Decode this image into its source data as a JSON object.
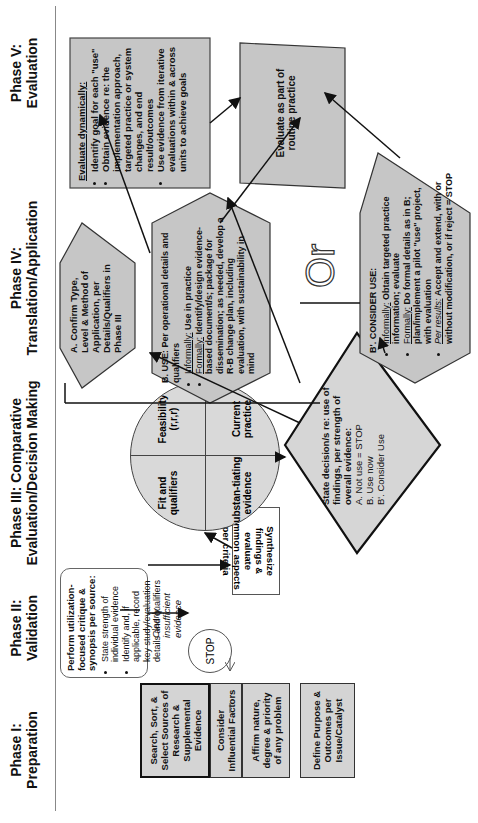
{
  "phases": [
    {
      "title_line1": "Phase I:",
      "title_line2": "Preparation"
    },
    {
      "title_line1": "Phase II:",
      "title_line2": "Validation"
    },
    {
      "title_line1": "Phase III: Comparative",
      "title_line2": "Evaluation/Decision Making"
    },
    {
      "title_line1": "Phase IV:",
      "title_line2": "Translation/Application"
    },
    {
      "title_line1": "Phase V:",
      "title_line2": "Evaluation"
    }
  ],
  "phase1": {
    "boxes": [
      {
        "label": "Search, Sort, & Select Sources of Research & Supplemental Evidence"
      },
      {
        "label": "Consider Influential Factors"
      },
      {
        "label": "Affirm nature, degree & priority of any problem"
      },
      {
        "label": "Define Purpose & Outcomes per Issue/Catalyst"
      }
    ]
  },
  "phase2": {
    "critique_title": "Perform utilization-focused critique & synopsis per source:",
    "critique_bullets": [
      "State strength of individual evidence",
      "Identify and, if applicable, record key study/evaluation details and qualifiers"
    ],
    "stop_label": "STOP",
    "stop_note": "Clearly insufficient evidence",
    "synthesize": "Synthesize findings & evaluate common aspects per criteria"
  },
  "phase3": {
    "quadrants": [
      {
        "label": "Fit and qualifiers"
      },
      {
        "label": "Feasibility (r,r,r)"
      },
      {
        "label": "Substan-tiating evidence"
      },
      {
        "label": "Current practice"
      }
    ],
    "decision": {
      "title": "State decision/s re: use of findings, per strength of overall evidence:",
      "options": [
        "A. Not use = STOP",
        "B. Use now",
        "B'. Consider Use"
      ]
    }
  },
  "phase4": {
    "confirm": "A. Confirm Type, Level & Method of Application, per Details/Qualifiers in Phase III",
    "use": {
      "title": "B. USE: Per operational details and qualifiers",
      "bullets": [
        {
          "label": "Informally:",
          "text": "Use in practice"
        },
        {
          "label": "Formally:",
          "text": "Identify/design evidence-based document/s; package for dissemination; as needed, develop a R-B change plan, including evaluation, with sustainability in mind"
        }
      ]
    },
    "or_label": "Or",
    "consider": {
      "title": "B'. CONSIDER USE:",
      "bullets": [
        {
          "label": "Informally:",
          "text": "Obtain targeted practice information; evaluate"
        },
        {
          "label": "Formally:",
          "text": "Do formal details as in B; plan/implement a pilot \"use\" project, with evaluation"
        },
        {
          "label": "Per results:",
          "text": "Accept and extend, with or without modification, or if reject = STOP"
        }
      ]
    }
  },
  "phase5": {
    "dynamic_title": "Evaluate dynamically:",
    "dynamic_bullets": [
      "Identify goal for each \"use\"",
      "Obtain evidence re: the implementation approach, targeted practice or system changes, and end result/outcomes",
      "Use evidence from iterative evaluations within & across units to achieve goals"
    ],
    "routine": "Evaluate as part of routine practice"
  }
}
